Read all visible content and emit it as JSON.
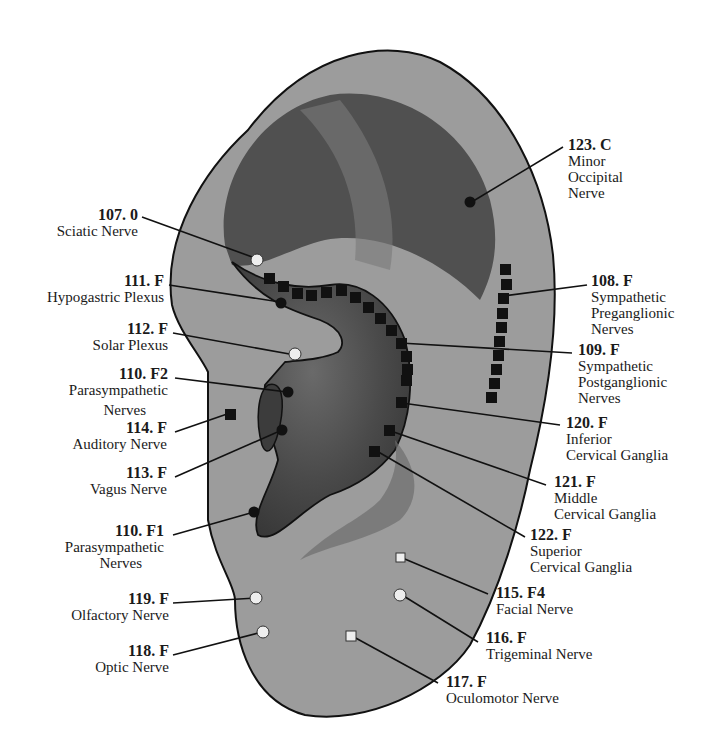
{
  "diagram": {
    "colors": {
      "ear_outer": "#9a9a9a",
      "ear_concha": "#4a4a4a",
      "ear_inner_dark": "#3a3a3a",
      "outline": "#111111",
      "marker_dark": "#111111",
      "marker_light": "#eeeeee"
    }
  },
  "labels": [
    {
      "id": "107",
      "code": "107. 0",
      "name": "Sciatic Nerve",
      "marker": "white-circle"
    },
    {
      "id": "111",
      "code": "111. F",
      "name": "Hypogastric Plexus",
      "marker": "black-circle"
    },
    {
      "id": "112",
      "code": "112. F",
      "name": "Solar Plexus",
      "marker": "white-circle"
    },
    {
      "id": "110f2",
      "code": "110. F2",
      "name": "Parasympathetic",
      "name2": "Nerves",
      "marker": "black-circle"
    },
    {
      "id": "114",
      "code": "114. F",
      "name": "Auditory Nerve",
      "marker": "black-square"
    },
    {
      "id": "113",
      "code": "113. F",
      "name": "Vagus Nerve",
      "marker": "black-circle"
    },
    {
      "id": "110f1",
      "code": "110. F1",
      "name": "Parasympathetic",
      "name2": "Nerves",
      "marker": "black-circle"
    },
    {
      "id": "119",
      "code": "119. F",
      "name": "Olfactory Nerve",
      "marker": "white-circle"
    },
    {
      "id": "118",
      "code": "118. F",
      "name": "Optic Nerve",
      "marker": "white-circle"
    },
    {
      "id": "123",
      "code": "123. C",
      "name": "Minor",
      "name2": "Occipital",
      "name3": "Nerve",
      "marker": "black-circle"
    },
    {
      "id": "108",
      "code": "108. F",
      "name": "Sympathetic",
      "name2": "Preganglionic",
      "name3": "Nerves",
      "marker": "black-square-chain"
    },
    {
      "id": "109",
      "code": "109. F",
      "name": "Sympathetic",
      "name2": "Postganglionic",
      "name3": "Nerves",
      "marker": "black-square-chain"
    },
    {
      "id": "120",
      "code": "120. F",
      "name": "Inferior",
      "name2": "Cervical Ganglia",
      "marker": "black-square"
    },
    {
      "id": "121",
      "code": "121. F",
      "name": "Middle",
      "name2": "Cervical Ganglia",
      "marker": "black-square"
    },
    {
      "id": "122",
      "code": "122. F",
      "name": "Superior",
      "name2": "Cervical Ganglia",
      "marker": "black-square"
    },
    {
      "id": "115",
      "code": "115. F4",
      "name": "Facial Nerve",
      "marker": "white-square"
    },
    {
      "id": "116",
      "code": "116. F",
      "name": "Trigeminal Nerve",
      "marker": "white-circle"
    },
    {
      "id": "117",
      "code": "117. F",
      "name": "Oculomotor Nerve",
      "marker": "white-square"
    }
  ]
}
